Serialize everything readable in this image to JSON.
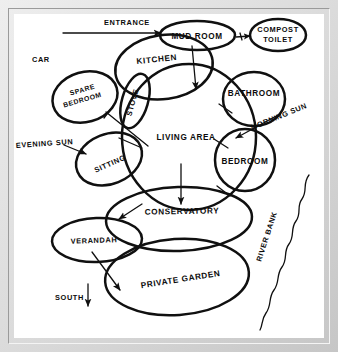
{
  "diagram": {
    "ink_color": "#101010",
    "paper_color": "#ffffff",
    "frame_color": "#d9d9d9",
    "zones": [
      {
        "id": "mud-room",
        "label": "MUD ROOM",
        "cx": 183,
        "cy": 22,
        "rx": 38,
        "ry": 14,
        "rot": 0,
        "label_rot": 0
      },
      {
        "id": "compost-toilet",
        "label_line1": "COMPOST",
        "label_line2": "TOILET",
        "cx": 264,
        "cy": 21,
        "rx": 28,
        "ry": 15,
        "rot": 0,
        "label_rot": 0
      },
      {
        "id": "kitchen",
        "label": "KITCHEN",
        "cx": 150,
        "cy": 53,
        "rx": 49,
        "ry": 32,
        "rot": -8,
        "label_rot": -6
      },
      {
        "id": "living-area",
        "label": "LIVING AREA",
        "cx": 175,
        "cy": 123,
        "rx": 67,
        "ry": 73,
        "rot": 0,
        "label_rot": 0
      },
      {
        "id": "spare-bedroom",
        "label_line1": "SPARE",
        "label_line2": "BEDROOM",
        "cx": 71,
        "cy": 83,
        "rx": 33,
        "ry": 25,
        "rot": -16,
        "label_rot": -16
      },
      {
        "id": "stove",
        "label": "STOVE",
        "cx": 121,
        "cy": 87,
        "rx": 13,
        "ry": 28,
        "rot": 16,
        "label_rot": -74
      },
      {
        "id": "bathroom",
        "label": "BATHROOM",
        "cx": 240,
        "cy": 85,
        "rx": 31,
        "ry": 27,
        "rot": 0,
        "label_rot": 0
      },
      {
        "id": "bedroom",
        "label": "BEDROOM",
        "cx": 231,
        "cy": 146,
        "rx": 30,
        "ry": 31,
        "rot": 0,
        "label_rot": 0
      },
      {
        "id": "sitting",
        "label": "SITTING",
        "cx": 95,
        "cy": 145,
        "rx": 34,
        "ry": 25,
        "rot": -22,
        "label_rot": -24
      },
      {
        "id": "conservatory",
        "label": "CONSERVATORY",
        "cx": 165,
        "cy": 205,
        "rx": 73,
        "ry": 32,
        "rot": -2,
        "label_rot": -1
      },
      {
        "id": "verandah",
        "label": "VERANDAH",
        "cx": 83,
        "cy": 226,
        "rx": 45,
        "ry": 22,
        "rot": -2,
        "label_rot": -2
      },
      {
        "id": "private-garden",
        "label": "PRIVATE GARDEN",
        "cx": 163,
        "cy": 263,
        "rx": 72,
        "ry": 38,
        "rot": -4,
        "label_rot": -9
      }
    ],
    "annotations": [
      {
        "id": "entrance",
        "label": "ENTRANCE",
        "x": 90,
        "y": 6,
        "rot": 0
      },
      {
        "id": "car",
        "label": "CAR",
        "x": 18,
        "y": 45,
        "rot": 0
      },
      {
        "id": "evening-sun",
        "label": "EVENING SUN",
        "x": 2,
        "y": 131,
        "rot": -4
      },
      {
        "id": "morning-sun",
        "label": "MORNING SUN",
        "x": 236,
        "y": 115,
        "rot": -22
      },
      {
        "id": "river-bank",
        "label": "RIVER BANK",
        "x": 247,
        "y": 245,
        "rot": -72
      },
      {
        "id": "south",
        "label": "SOUTH",
        "x": 41,
        "y": 283,
        "rot": 0
      }
    ],
    "arrows": [
      {
        "id": "entrance-arrow",
        "from": "entrance-line",
        "to": "mud-room"
      },
      {
        "id": "mud-room-to-compost",
        "from": "mud-room",
        "to": "compost-toilet"
      },
      {
        "id": "mud-room-to-living",
        "from": "mud-room",
        "to": "living-area"
      },
      {
        "id": "spare-bedroom-pointer",
        "from": "spare-bedroom",
        "to": "sitting"
      },
      {
        "id": "evening-sun-arrow",
        "from": "evening-sun",
        "to": "sitting"
      },
      {
        "id": "morning-sun-arrow",
        "from": "morning-sun",
        "to": "bedroom"
      },
      {
        "id": "living-to-conservatory",
        "from": "living-area",
        "to": "conservatory"
      },
      {
        "id": "conservatory-pointer",
        "from": "conservatory",
        "to": "verandah"
      },
      {
        "id": "verandah-to-garden",
        "from": "verandah",
        "to": "private-garden"
      },
      {
        "id": "south-arrow",
        "from": "south",
        "to": "down"
      }
    ]
  }
}
